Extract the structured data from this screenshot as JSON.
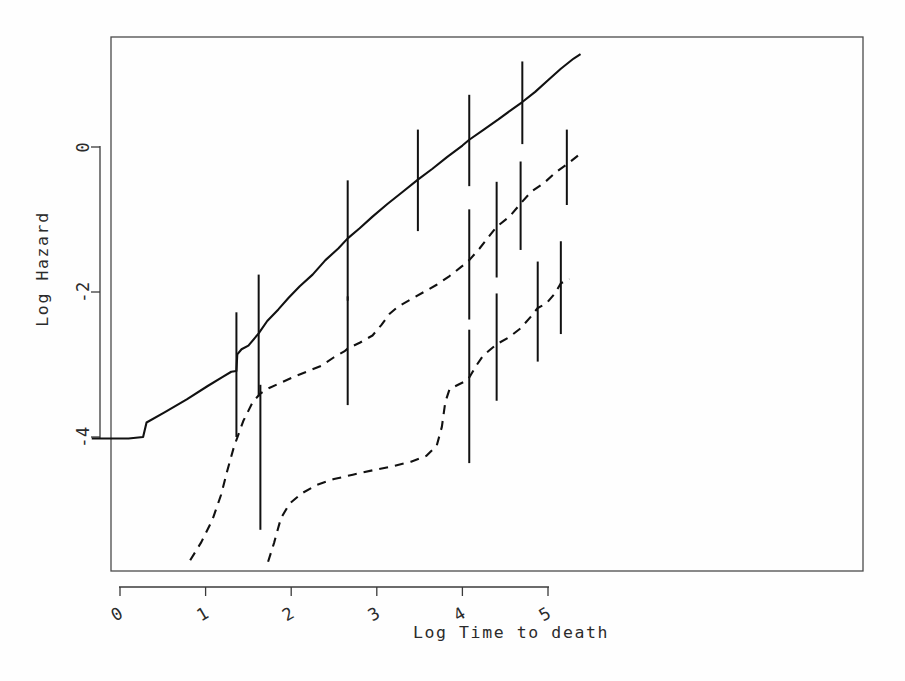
{
  "chart_data": {
    "type": "line",
    "title": "",
    "subtitle": "",
    "xlabel": "Log Time to death",
    "ylabel": "Log Hazard",
    "xlim": [
      -0.33,
      5.45
    ],
    "ylim": [
      -6.35,
      1.55
    ],
    "xticks": [
      0,
      1,
      2,
      3,
      4,
      5
    ],
    "xticklabels": [
      "0",
      "1",
      "2",
      "3",
      "4",
      "5"
    ],
    "yticks": [
      0,
      -2,
      -4
    ],
    "yticklabels": [
      "0",
      "-2",
      "-4"
    ],
    "grid": false,
    "legend": false,
    "legend_position": "none",
    "box": true,
    "background": "#ffffff",
    "line_color": "#111111",
    "series": [
      {
        "name": "curve-1",
        "style": "solid",
        "points": [
          [
            -0.33,
            -4.02
          ],
          [
            0.1,
            -4.02
          ],
          [
            0.27,
            -4.0
          ],
          [
            0.31,
            -3.8
          ],
          [
            0.52,
            -3.66
          ],
          [
            0.78,
            -3.48
          ],
          [
            1.02,
            -3.3
          ],
          [
            1.2,
            -3.17
          ],
          [
            1.3,
            -3.1
          ],
          [
            1.36,
            -3.09
          ],
          [
            1.37,
            -2.86
          ],
          [
            1.42,
            -2.79
          ],
          [
            1.5,
            -2.74
          ],
          [
            1.62,
            -2.57
          ],
          [
            1.72,
            -2.4
          ],
          [
            1.85,
            -2.24
          ],
          [
            1.97,
            -2.08
          ],
          [
            2.1,
            -1.92
          ],
          [
            2.25,
            -1.76
          ],
          [
            2.4,
            -1.56
          ],
          [
            2.55,
            -1.4
          ],
          [
            2.66,
            -1.26
          ],
          [
            2.8,
            -1.12
          ],
          [
            2.95,
            -0.96
          ],
          [
            3.12,
            -0.79
          ],
          [
            3.3,
            -0.62
          ],
          [
            3.48,
            -0.45
          ],
          [
            3.65,
            -0.3
          ],
          [
            3.82,
            -0.14
          ],
          [
            4.0,
            0.02
          ],
          [
            4.08,
            0.1
          ],
          [
            4.25,
            0.24
          ],
          [
            4.42,
            0.38
          ],
          [
            4.58,
            0.52
          ],
          [
            4.7,
            0.62
          ],
          [
            4.85,
            0.76
          ],
          [
            5.0,
            0.92
          ],
          [
            5.15,
            1.08
          ],
          [
            5.3,
            1.22
          ],
          [
            5.38,
            1.28
          ]
        ]
      },
      {
        "name": "curve-2",
        "style": "dashed",
        "points": [
          [
            0.82,
            -5.7
          ],
          [
            0.95,
            -5.45
          ],
          [
            1.08,
            -5.14
          ],
          [
            1.18,
            -4.8
          ],
          [
            1.25,
            -4.48
          ],
          [
            1.33,
            -4.14
          ],
          [
            1.44,
            -3.78
          ],
          [
            1.55,
            -3.52
          ],
          [
            1.64,
            -3.4
          ],
          [
            1.75,
            -3.32
          ],
          [
            1.9,
            -3.24
          ],
          [
            2.05,
            -3.16
          ],
          [
            2.22,
            -3.08
          ],
          [
            2.35,
            -3.02
          ],
          [
            2.5,
            -2.9
          ],
          [
            2.62,
            -2.82
          ],
          [
            2.66,
            -2.78
          ],
          [
            2.8,
            -2.7
          ],
          [
            2.95,
            -2.6
          ],
          [
            3.05,
            -2.46
          ],
          [
            3.15,
            -2.3
          ],
          [
            3.25,
            -2.2
          ],
          [
            3.4,
            -2.1
          ],
          [
            3.55,
            -2.0
          ],
          [
            3.7,
            -1.9
          ],
          [
            3.85,
            -1.78
          ],
          [
            4.0,
            -1.64
          ],
          [
            4.08,
            -1.56
          ],
          [
            4.2,
            -1.4
          ],
          [
            4.32,
            -1.22
          ],
          [
            4.4,
            -1.1
          ],
          [
            4.55,
            -0.96
          ],
          [
            4.68,
            -0.78
          ],
          [
            4.8,
            -0.62
          ],
          [
            4.95,
            -0.5
          ],
          [
            5.1,
            -0.34
          ],
          [
            5.22,
            -0.24
          ],
          [
            5.35,
            -0.12
          ]
        ]
      },
      {
        "name": "curve-3",
        "style": "dashed",
        "points": [
          [
            1.73,
            -5.72
          ],
          [
            1.8,
            -5.46
          ],
          [
            1.88,
            -5.12
          ],
          [
            1.98,
            -4.92
          ],
          [
            2.12,
            -4.78
          ],
          [
            2.3,
            -4.66
          ],
          [
            2.5,
            -4.58
          ],
          [
            2.72,
            -4.52
          ],
          [
            2.95,
            -4.46
          ],
          [
            3.2,
            -4.4
          ],
          [
            3.4,
            -4.34
          ],
          [
            3.58,
            -4.26
          ],
          [
            3.7,
            -4.12
          ],
          [
            3.76,
            -3.86
          ],
          [
            3.8,
            -3.52
          ],
          [
            3.85,
            -3.34
          ],
          [
            3.95,
            -3.28
          ],
          [
            4.05,
            -3.22
          ],
          [
            4.08,
            -3.18
          ],
          [
            4.16,
            -3.02
          ],
          [
            4.24,
            -2.88
          ],
          [
            4.32,
            -2.8
          ],
          [
            4.4,
            -2.72
          ],
          [
            4.55,
            -2.62
          ],
          [
            4.68,
            -2.5
          ],
          [
            4.8,
            -2.34
          ],
          [
            4.88,
            -2.22
          ],
          [
            4.98,
            -2.16
          ],
          [
            5.08,
            -2.02
          ],
          [
            5.15,
            -1.88
          ],
          [
            5.25,
            -1.82
          ]
        ]
      }
    ],
    "errorbars": [
      {
        "series": "curve-1",
        "x": 1.36,
        "y": -3.08,
        "low": -4.0,
        "high": -2.28
      },
      {
        "series": "curve-1",
        "x": 1.62,
        "y": -2.57,
        "low": -3.44,
        "high": -1.76
      },
      {
        "series": "curve-1",
        "x": 2.66,
        "y": -1.26,
        "low": -2.12,
        "high": -0.46
      },
      {
        "series": "curve-1",
        "x": 3.48,
        "y": -0.45,
        "low": -1.16,
        "high": 0.24
      },
      {
        "series": "curve-1",
        "x": 4.08,
        "y": 0.1,
        "low": -0.54,
        "high": 0.72
      },
      {
        "series": "curve-1",
        "x": 4.7,
        "y": 0.62,
        "low": 0.04,
        "high": 1.18
      },
      {
        "series": "curve-2",
        "x": 1.64,
        "y": -3.4,
        "low": -5.28,
        "high": -3.28
      },
      {
        "series": "curve-2",
        "x": 2.66,
        "y": -2.78,
        "low": -3.56,
        "high": -2.06
      },
      {
        "series": "curve-2",
        "x": 4.08,
        "y": -1.56,
        "low": -2.38,
        "high": -0.86
      },
      {
        "series": "curve-2",
        "x": 4.4,
        "y": -1.1,
        "low": -1.8,
        "high": -0.48
      },
      {
        "series": "curve-2",
        "x": 4.68,
        "y": -0.78,
        "low": -1.42,
        "high": -0.2
      },
      {
        "series": "curve-2",
        "x": 5.22,
        "y": -0.24,
        "low": -0.8,
        "high": 0.24
      },
      {
        "series": "curve-3",
        "x": 4.08,
        "y": -3.18,
        "low": -4.36,
        "high": -2.52
      },
      {
        "series": "curve-3",
        "x": 4.4,
        "y": -2.72,
        "low": -3.5,
        "high": -2.02
      },
      {
        "series": "curve-3",
        "x": 4.88,
        "y": -2.22,
        "low": -2.96,
        "high": -1.58
      },
      {
        "series": "curve-3",
        "x": 5.15,
        "y": -1.88,
        "low": -2.58,
        "high": -1.3
      }
    ]
  }
}
